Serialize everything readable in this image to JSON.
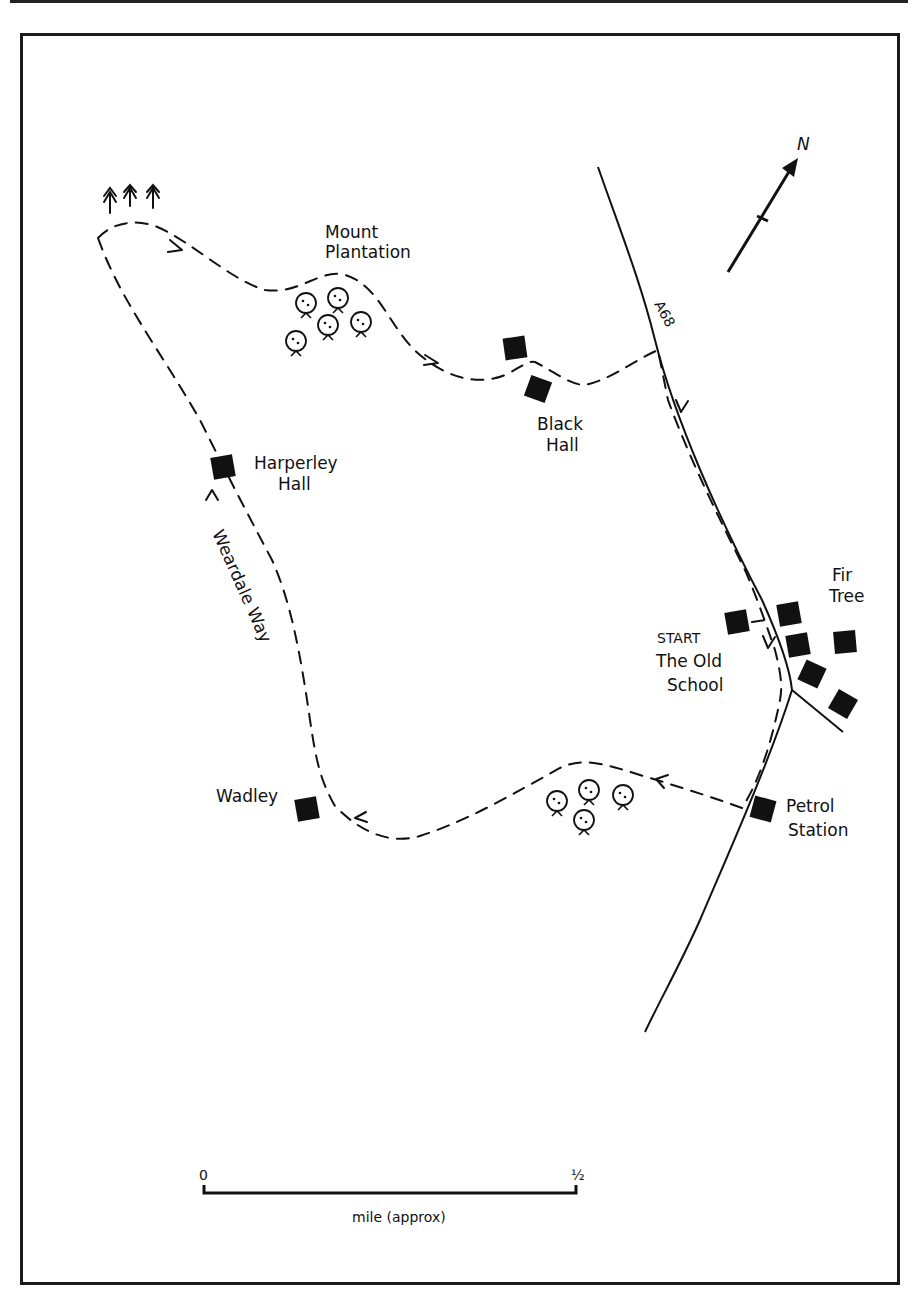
{
  "map": {
    "north_label": "N",
    "road_label": "A68",
    "places": {
      "mount_plantation": [
        "Mount",
        "Plantation"
      ],
      "black_hall": [
        "Black",
        "Hall"
      ],
      "harperley_hall": [
        "Harperley",
        "Hall"
      ],
      "weardale_way": "Weardale Way",
      "fir_tree": [
        "Fir",
        "Tree"
      ],
      "start": [
        "START",
        "The Old",
        "School"
      ],
      "wadley": "Wadley",
      "petrol_station": [
        "Petrol",
        "Station"
      ]
    },
    "scale": {
      "start_label": "0",
      "end_label": "½",
      "unit_label": "mile (approx)"
    },
    "icons": [
      "north-arrow-icon",
      "building-icon",
      "deciduous-tree-icon",
      "conifer-tree-icon",
      "route-direction-arrow-icon"
    ],
    "colors": {
      "ink": "#111111",
      "paper": "#ffffff"
    }
  }
}
